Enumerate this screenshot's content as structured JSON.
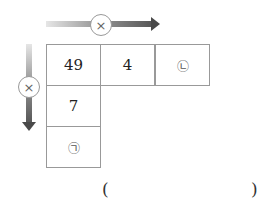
{
  "diagram": {
    "operators": {
      "horizontal": {
        "symbol": "×",
        "icon": "multiply-icon",
        "direction": "right"
      },
      "vertical": {
        "symbol": "×",
        "icon": "multiply-icon",
        "direction": "down"
      }
    },
    "grid": {
      "row1": [
        "49",
        "4",
        "㉡"
      ],
      "col1": [
        "49",
        "7",
        "㉠"
      ]
    },
    "answer": {
      "open": "(",
      "close": ")",
      "value": ""
    }
  }
}
